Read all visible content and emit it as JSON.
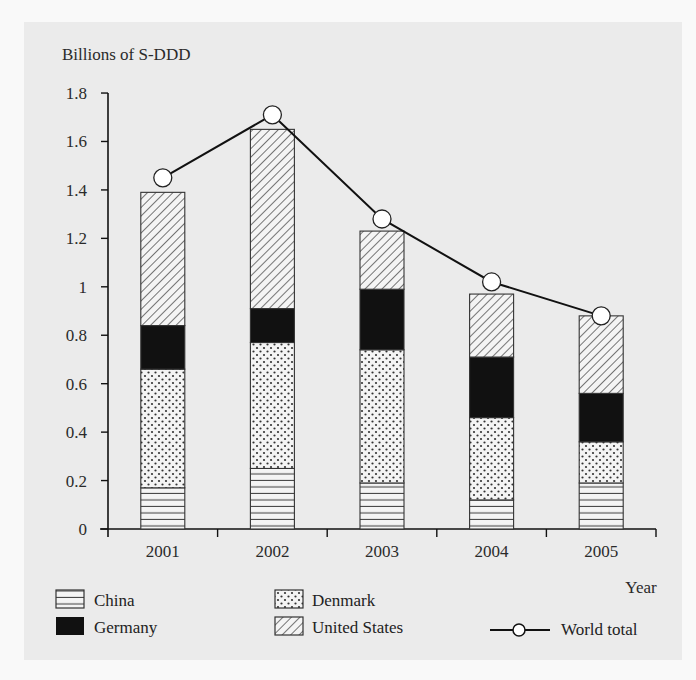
{
  "heading_partial": "",
  "chart_data": {
    "type": "bar",
    "stacked": true,
    "title": "",
    "ylabel": "Billions of S-DDD",
    "xlabel": "Year",
    "ylim": [
      0,
      1.8
    ],
    "yticks": [
      0,
      0.2,
      0.4,
      0.6,
      0.8,
      1,
      1.2,
      1.4,
      1.6,
      1.8
    ],
    "ytick_labels": [
      "0",
      "0.2",
      "0.4",
      "0.6",
      "0.8",
      "1",
      "1.2",
      "1.4",
      "1.6",
      "1.8"
    ],
    "categories": [
      "2001",
      "2002",
      "2003",
      "2004",
      "2005"
    ],
    "grid": false,
    "legend_position": "bottom",
    "series": [
      {
        "name": "China",
        "pattern": "horizontal-lines",
        "values": [
          0.17,
          0.25,
          0.19,
          0.12,
          0.19
        ]
      },
      {
        "name": "Denmark",
        "pattern": "dots",
        "values": [
          0.49,
          0.52,
          0.55,
          0.34,
          0.17
        ]
      },
      {
        "name": "Germany",
        "pattern": "solid-black",
        "values": [
          0.18,
          0.14,
          0.25,
          0.25,
          0.2
        ]
      },
      {
        "name": "United States",
        "pattern": "diagonal-lines",
        "values": [
          0.55,
          0.74,
          0.24,
          0.26,
          0.32
        ]
      }
    ],
    "line_series": {
      "name": "World total",
      "marker": "open-circle",
      "values": [
        1.45,
        1.71,
        1.28,
        1.02,
        0.88
      ]
    },
    "stack_totals": [
      1.39,
      1.65,
      1.23,
      0.97,
      0.88
    ]
  },
  "legend": {
    "items": [
      {
        "label": "China",
        "pattern": "horizontal-lines"
      },
      {
        "label": "Germany",
        "pattern": "solid-black"
      },
      {
        "label": "Denmark",
        "pattern": "dots"
      },
      {
        "label": "United States",
        "pattern": "diagonal-lines"
      },
      {
        "label": "World total",
        "pattern": "line-marker"
      }
    ]
  },
  "colors": {
    "panel_bg": "#ebebeb",
    "page_bg": "#f9f9f9",
    "ink": "#1a1a1a",
    "bar_fill": "#f4f4f4",
    "marker_fill": "#ffffff"
  }
}
